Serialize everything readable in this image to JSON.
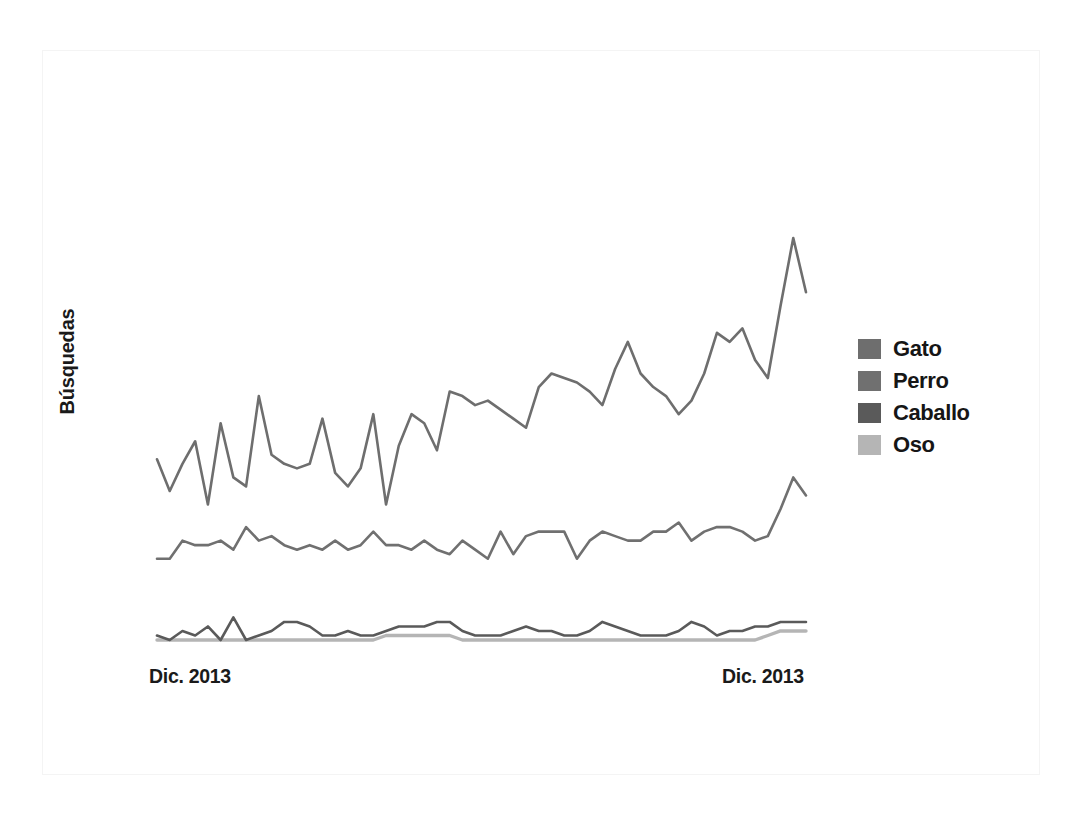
{
  "figure": {
    "background_color": "#ffffff",
    "frame_color": "#f4f4f4"
  },
  "axis": {
    "y_label": "Búsquedas",
    "x_tick_left": "Dic. 2013",
    "x_tick_right": "Dic. 2013"
  },
  "legend": {
    "position": "right",
    "items": [
      {
        "label": "Gato",
        "color": "#6e6e6e"
      },
      {
        "label": "Perro",
        "color": "#707070"
      },
      {
        "label": "Caballo",
        "color": "#5a5a5a"
      },
      {
        "label": "Oso",
        "color": "#b5b5b5"
      }
    ]
  },
  "chart_data": {
    "type": "line",
    "title": "",
    "xlabel": "",
    "ylabel": "Búsquedas",
    "grid": false,
    "legend_position": "right",
    "x_tick_labels": [
      "Dic. 2013",
      "Dic. 2013"
    ],
    "xlim": [
      0,
      52
    ],
    "ylim": [
      0,
      100
    ],
    "x": [
      0,
      1,
      2,
      3,
      4,
      5,
      6,
      7,
      8,
      9,
      10,
      11,
      12,
      13,
      14,
      15,
      16,
      17,
      18,
      19,
      20,
      21,
      22,
      23,
      24,
      25,
      26,
      27,
      28,
      29,
      30,
      31,
      32,
      33,
      34,
      35,
      36,
      37,
      38,
      39,
      40,
      41,
      42,
      43,
      44,
      45,
      46,
      47,
      48,
      49,
      50,
      51
    ],
    "series": [
      {
        "name": "Gato",
        "color": "#6e6e6e",
        "values": [
          44,
          37,
          43,
          48,
          34,
          52,
          40,
          38,
          58,
          45,
          43,
          42,
          43,
          53,
          41,
          38,
          42,
          54,
          34,
          47,
          54,
          52,
          46,
          59,
          58,
          56,
          57,
          55,
          53,
          51,
          60,
          63,
          62,
          61,
          59,
          56,
          64,
          70,
          63,
          60,
          58,
          54,
          57,
          63,
          72,
          70,
          73,
          66,
          62,
          78,
          93,
          81
        ]
      },
      {
        "name": "Perro",
        "color": "#707070",
        "values": [
          22,
          22,
          26,
          25,
          25,
          26,
          24,
          29,
          26,
          27,
          25,
          24,
          25,
          24,
          26,
          24,
          25,
          28,
          25,
          25,
          24,
          26,
          24,
          23,
          26,
          24,
          22,
          28,
          23,
          27,
          28,
          28,
          28,
          22,
          26,
          28,
          27,
          26,
          26,
          28,
          28,
          30,
          26,
          28,
          29,
          29,
          28,
          26,
          27,
          33,
          40,
          36
        ]
      },
      {
        "name": "Caballo",
        "color": "#5a5a5a",
        "values": [
          5,
          4,
          6,
          5,
          7,
          4,
          9,
          4,
          5,
          6,
          8,
          8,
          7,
          5,
          5,
          6,
          5,
          5,
          6,
          7,
          7,
          7,
          8,
          8,
          6,
          5,
          5,
          5,
          6,
          7,
          6,
          6,
          5,
          5,
          6,
          8,
          7,
          6,
          5,
          5,
          5,
          6,
          8,
          7,
          5,
          6,
          6,
          7,
          7,
          8,
          8,
          8
        ]
      },
      {
        "name": "Oso",
        "color": "#b5b5b5",
        "values": [
          4,
          4,
          4,
          4,
          4,
          4,
          4,
          4,
          4,
          4,
          4,
          4,
          4,
          4,
          4,
          4,
          4,
          4,
          5,
          5,
          5,
          5,
          5,
          5,
          4,
          4,
          4,
          4,
          4,
          4,
          4,
          4,
          4,
          4,
          4,
          4,
          4,
          4,
          4,
          4,
          4,
          4,
          4,
          4,
          4,
          4,
          4,
          4,
          5,
          6,
          6,
          6
        ]
      }
    ]
  }
}
